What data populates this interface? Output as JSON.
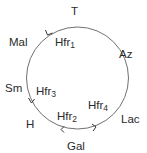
{
  "diagram": {
    "type": "circular-chromosome-map",
    "circle": {
      "cx": 77.5,
      "cy": 78,
      "r": 51,
      "stroke": "#707070"
    },
    "outer_markers": [
      {
        "id": "T",
        "label": "T",
        "x": 70,
        "y": 6
      },
      {
        "id": "Az",
        "label": "Az",
        "x": 118,
        "y": 49
      },
      {
        "id": "Lac",
        "label": "Lac",
        "x": 121,
        "y": 114
      },
      {
        "id": "Gal",
        "label": "Gal",
        "x": 67,
        "y": 141
      },
      {
        "id": "H",
        "label": "H",
        "x": 26,
        "y": 119
      },
      {
        "id": "Sm",
        "label": "Sm",
        "x": 5,
        "y": 83
      },
      {
        "id": "Mal",
        "label": "Mal",
        "x": 9,
        "y": 37
      }
    ],
    "hfr_strains": [
      {
        "id": "Hfr1",
        "base": "Hfr",
        "sub": "1",
        "x": 55,
        "y": 37,
        "direction": "counterclockwise"
      },
      {
        "id": "Hfr3",
        "base": "Hfr",
        "sub": "3",
        "x": 36,
        "y": 86,
        "direction": "counterclockwise"
      },
      {
        "id": "Hfr2",
        "base": "Hfr",
        "sub": "2",
        "x": 57,
        "y": 111,
        "direction": "clockwise"
      },
      {
        "id": "Hfr4",
        "base": "Hfr",
        "sub": "4",
        "x": 87,
        "y": 100,
        "direction": "counterclockwise"
      }
    ],
    "arrows": [
      {
        "id": "arrow-hfr1",
        "at_deg": 235,
        "dir": "ccw"
      },
      {
        "id": "arrow-hfr3",
        "at_deg": 152,
        "dir": "ccw"
      },
      {
        "id": "arrow-hfr2",
        "at_deg": 107,
        "dir": "cw"
      },
      {
        "id": "arrow-hfr4",
        "at_deg": 68,
        "dir": "ccw"
      }
    ]
  }
}
